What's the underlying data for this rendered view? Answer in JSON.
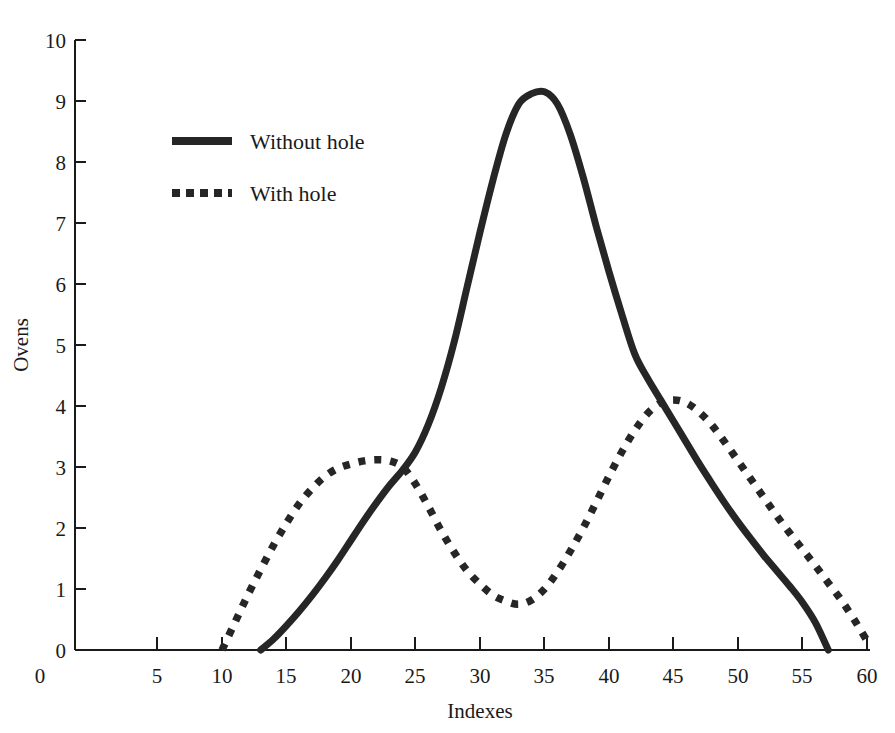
{
  "chart_data": {
    "type": "line",
    "title": "",
    "xlabel": "Indexes",
    "ylabel": "Ovens",
    "xlim": [
      0,
      62
    ],
    "ylim": [
      0,
      10
    ],
    "grid": false,
    "legend_position": "upper-left-center",
    "xticks": [
      5,
      10,
      15,
      20,
      25,
      30,
      35,
      40,
      45,
      50,
      55,
      60
    ],
    "xtick_labels": [
      "5",
      "10",
      "15",
      "20",
      "25",
      "30",
      "35",
      "40",
      "45",
      "50",
      "55",
      "60"
    ],
    "yticks": [
      0,
      1,
      2,
      3,
      4,
      5,
      6,
      7,
      8,
      9,
      10
    ],
    "ytick_labels": [
      "0",
      "1",
      "2",
      "3",
      "4",
      "5",
      "6",
      "7",
      "8",
      "9",
      "10"
    ],
    "origin_label": "0",
    "series": [
      {
        "name": "Without hole",
        "style": "solid",
        "color": "#262626",
        "x": [
          13,
          14,
          15,
          16,
          17,
          18,
          19,
          20,
          21,
          22,
          23,
          24,
          25,
          26,
          27,
          28,
          29,
          30,
          31,
          32,
          33,
          34,
          35,
          36,
          37,
          38,
          39,
          40,
          41,
          42,
          43,
          44,
          45,
          46,
          47,
          48,
          49,
          50,
          51,
          52,
          53,
          54,
          55,
          56,
          57
        ],
        "y": [
          0.0,
          0.18,
          0.4,
          0.64,
          0.9,
          1.18,
          1.48,
          1.8,
          2.12,
          2.42,
          2.7,
          2.95,
          3.25,
          3.7,
          4.3,
          5.05,
          5.95,
          6.85,
          7.7,
          8.45,
          8.95,
          9.12,
          9.15,
          8.95,
          8.45,
          7.75,
          6.95,
          6.2,
          5.5,
          4.85,
          4.45,
          4.1,
          3.75,
          3.4,
          3.05,
          2.72,
          2.4,
          2.1,
          1.82,
          1.55,
          1.3,
          1.05,
          0.78,
          0.45,
          0.0
        ]
      },
      {
        "name": "With hole",
        "style": "dotted",
        "color": "#262626",
        "x": [
          10,
          11,
          12,
          13,
          14,
          15,
          16,
          17,
          18,
          19,
          20,
          21,
          22,
          23,
          24,
          25,
          26,
          27,
          28,
          29,
          30,
          31,
          32,
          33,
          34,
          35,
          36,
          37,
          38,
          39,
          40,
          41,
          42,
          43,
          44,
          45,
          46,
          47,
          48,
          49,
          50,
          51,
          52,
          53,
          54,
          55,
          56,
          57,
          58,
          59,
          60
        ],
        "y": [
          0.0,
          0.45,
          0.9,
          1.32,
          1.72,
          2.08,
          2.4,
          2.65,
          2.85,
          2.98,
          3.05,
          3.1,
          3.12,
          3.1,
          3.0,
          2.72,
          2.35,
          1.95,
          1.6,
          1.3,
          1.08,
          0.9,
          0.8,
          0.75,
          0.82,
          1.0,
          1.28,
          1.62,
          2.0,
          2.42,
          2.85,
          3.25,
          3.6,
          3.88,
          4.05,
          4.1,
          4.05,
          3.9,
          3.68,
          3.4,
          3.1,
          2.8,
          2.5,
          2.2,
          1.92,
          1.65,
          1.38,
          1.1,
          0.82,
          0.5,
          0.15
        ]
      }
    ],
    "annotations": {
      "solid_peak": {
        "x": 35,
        "y": 9.15
      },
      "dotted_first_peak": {
        "x": 22,
        "y": 3.12
      },
      "dotted_valley": {
        "x": 33,
        "y": 0.75
      },
      "dotted_second_peak": {
        "x": 45,
        "y": 4.1
      },
      "crossing_left": {
        "x": 25,
        "y": 2.7
      },
      "crossing_right": {
        "x": 44,
        "y": 4.05
      }
    }
  },
  "legend": {
    "items": [
      {
        "label": "Without hole",
        "style": "solid"
      },
      {
        "label": "With hole",
        "style": "dotted"
      }
    ]
  }
}
